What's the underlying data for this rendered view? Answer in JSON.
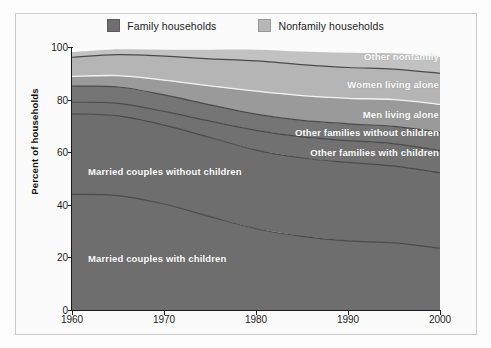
{
  "legend": {
    "items": [
      {
        "label": "Family households",
        "color": "#6e6e6e",
        "name": "family-households"
      },
      {
        "label": "Nonfamily households",
        "color": "#b7b7b7",
        "name": "nonfamily-households"
      }
    ]
  },
  "axes": {
    "y_title": "Percent of households",
    "y_ticks": [
      "0",
      "20",
      "40",
      "60",
      "80",
      "100"
    ],
    "x_ticks": [
      "1960",
      "1970",
      "1980",
      "1990",
      "2000"
    ]
  },
  "band_labels": {
    "other_nonfamily": "Other nonfamily",
    "women_living_alone": "Women living alone",
    "men_living_alone": "Men living alone",
    "other_families_without_children": "Other families without children",
    "other_families_with_children": "Other families with children",
    "married_without_children": "Married couples without children",
    "married_with_children": "Married couples with children"
  },
  "chart_data": {
    "type": "area",
    "title": "",
    "subtitle": "",
    "xlabel": "",
    "ylabel": "Percent of households",
    "xlim": [
      1960,
      2000
    ],
    "ylim": [
      0,
      100
    ],
    "grid": false,
    "stacked": true,
    "stack_total": 100,
    "legend_position": "top-center",
    "x": [
      1960,
      1965,
      1970,
      1975,
      1980,
      1985,
      1990,
      1995,
      2000
    ],
    "x_tick_labels": [
      "1960",
      "1970",
      "1980",
      "1990",
      "2000"
    ],
    "y_tick_labels": [
      "0",
      "20",
      "40",
      "60",
      "80",
      "100"
    ],
    "series": [
      {
        "name": "Married couples with children",
        "group": "Family households",
        "color": "#6e6e6e",
        "label_position": "left",
        "values": [
          44.0,
          43.5,
          40.3,
          35.5,
          30.9,
          28.0,
          26.3,
          25.5,
          23.5
        ]
      },
      {
        "name": "Married couples without children",
        "group": "Family households",
        "color": "#6e6e6e",
        "label_position": "left",
        "values": [
          30.6,
          30.3,
          30.0,
          30.1,
          29.9,
          29.8,
          29.8,
          29.2,
          28.7
        ]
      },
      {
        "name": "Other families with children",
        "group": "Family households",
        "color": "#717171",
        "label_position": "right",
        "values": [
          4.4,
          4.8,
          5.2,
          6.2,
          7.5,
          8.0,
          8.3,
          8.5,
          8.5
        ]
      },
      {
        "name": "Other families without children",
        "group": "Family households",
        "color": "#757575",
        "label_position": "right",
        "values": [
          6.1,
          6.2,
          6.3,
          6.2,
          6.2,
          6.3,
          6.4,
          6.6,
          6.8
        ]
      },
      {
        "name": "Men living alone",
        "group": "Nonfamily households",
        "color": "#9a9a9a",
        "label_position": "right",
        "values": [
          3.7,
          4.3,
          5.6,
          7.2,
          8.7,
          9.4,
          9.7,
          10.2,
          10.7
        ]
      },
      {
        "name": "Women living alone",
        "group": "Nonfamily households",
        "color": "#b5b5b5",
        "label_position": "right",
        "values": [
          7.3,
          8.0,
          9.1,
          10.3,
          11.5,
          11.8,
          11.7,
          11.6,
          11.8
        ]
      },
      {
        "name": "Other nonfamily",
        "group": "Nonfamily households",
        "color": "#c2c2c2",
        "label_position": "right",
        "values": [
          1.9,
          2.0,
          2.5,
          3.5,
          4.3,
          5.0,
          5.6,
          6.0,
          6.2
        ]
      }
    ]
  }
}
